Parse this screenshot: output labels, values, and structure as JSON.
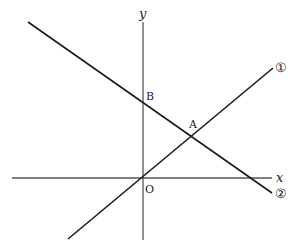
{
  "diagram": {
    "type": "coordinate-plane",
    "axes": {
      "x_label": "x",
      "y_label": "y",
      "origin_label": "O"
    },
    "points": [
      {
        "name": "A",
        "label": "A",
        "description": "intersection of line ① and line ②"
      },
      {
        "name": "B",
        "label": "B",
        "description": "y-intercept of line ②"
      },
      {
        "name": "O",
        "label": "O",
        "description": "origin"
      }
    ],
    "lines": [
      {
        "id": "line-1",
        "label": "①",
        "description": "line through the origin and A, increasing"
      },
      {
        "id": "line-2",
        "label": "②",
        "description": "line through B and A, decreasing"
      }
    ],
    "colors": {
      "line": "#1a1a1a",
      "axis": "#555555",
      "background": "#ffffff"
    }
  }
}
